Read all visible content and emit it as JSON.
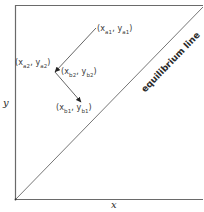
{
  "diagram": {
    "type": "diagram",
    "axes": {
      "x_label": "x",
      "y_label": "y"
    },
    "equilibrium_line": {
      "label": "equilibrium line"
    },
    "points": {
      "a1": {
        "label": "(xₐ₁, yₐ₁)",
        "x_sub": "a1",
        "y_sub": "a1"
      },
      "a2": {
        "label": "(xₐ₂, yₐ₂)",
        "x_sub": "a2",
        "y_sub": "a2"
      },
      "b2": {
        "label": "(xᵦ₂, yᵦ₂)",
        "x_sub": "b2",
        "y_sub": "b2"
      },
      "b1": {
        "label": "(xᵦ₁, yᵦ₁)",
        "x_sub": "b1",
        "y_sub": "b1"
      }
    },
    "label_text": {
      "a1": "(x",
      "a1_xsub": "a1",
      "a1_mid": ", y",
      "a1_ysub": "a1",
      "a1_end": ")",
      "a2": "(x",
      "a2_xsub": "a2",
      "a2_mid": ", y",
      "a2_ysub": "a2",
      "a2_end": ")",
      "b2": "(x",
      "b2_xsub": "b2",
      "b2_mid": ", y",
      "b2_ysub": "b2",
      "b2_end": ")",
      "b1": "(x",
      "b1_xsub": "b1",
      "b1_mid": ", y",
      "b1_ysub": "b1",
      "b1_end": ")"
    },
    "arrows": [
      {
        "from": "a1",
        "to": "a2"
      },
      {
        "from": "a2",
        "to": "b1"
      }
    ],
    "colors": {
      "line": "#555555",
      "frame": "#6a6a6a",
      "text": "#3a3a3a"
    }
  }
}
